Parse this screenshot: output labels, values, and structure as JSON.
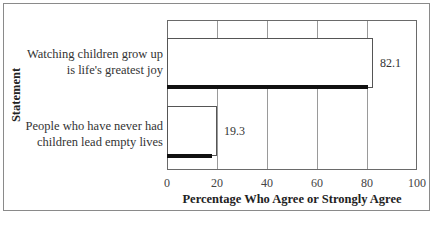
{
  "chart_data": {
    "type": "bar",
    "orientation": "horizontal",
    "title": "",
    "categories": [
      "Watching children grow up is life's greatest joy",
      "People who have never had children lead empty lives"
    ],
    "category_lines": [
      [
        "Watching children grow up",
        "is life's greatest joy"
      ],
      [
        "People who have never had",
        "children lead empty lives"
      ]
    ],
    "values": [
      82.1,
      19.3
    ],
    "value_labels": [
      "82.1",
      "19.3"
    ],
    "xlabel": "Percentage Who Agree or Strongly Agree",
    "ylabel": "Statement",
    "xlim": [
      0,
      100
    ],
    "xticks": [
      "0",
      "20",
      "40",
      "60",
      "80",
      "100"
    ],
    "grid": "vertical",
    "legend": null,
    "colors": {
      "bar_fill": "#ffffff",
      "bar_border": "#555555",
      "bar_shadow": "#111111",
      "grid": "#9a9a9a"
    }
  }
}
